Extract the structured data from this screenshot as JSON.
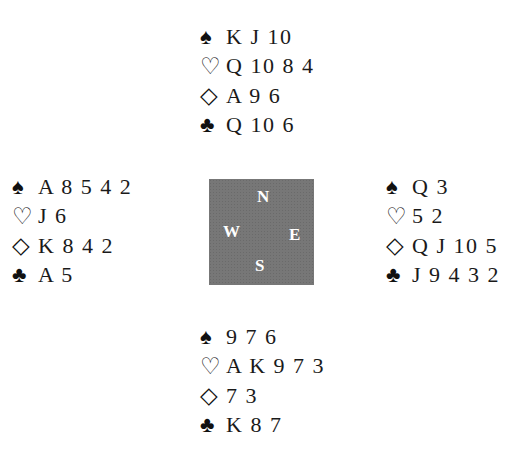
{
  "suits": {
    "spades": "♠",
    "hearts": "♡",
    "diamonds": "◇",
    "clubs": "♣"
  },
  "hands": {
    "north": {
      "spades": "K J 10",
      "hearts": "Q 10 8 4",
      "diamonds": "A 9 6",
      "clubs": "Q 10 6"
    },
    "west": {
      "spades": "A 8 5 4 2",
      "hearts": "J 6",
      "diamonds": "K 8 4 2",
      "clubs": "A 5"
    },
    "east": {
      "spades": "Q 3",
      "hearts": "5 2",
      "diamonds": "Q J 10 5",
      "clubs": "J 9 4 3 2"
    },
    "south": {
      "spades": "9 7 6",
      "hearts": "A K 9 7 3",
      "diamonds": "7 3",
      "clubs": "K 8 7"
    }
  },
  "compass": {
    "north": "N",
    "west": "W",
    "east": "E",
    "south": "S"
  }
}
